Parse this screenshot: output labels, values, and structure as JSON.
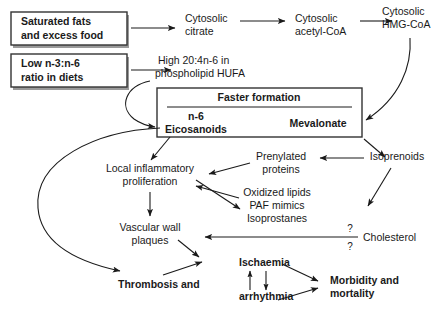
{
  "diagram": {
    "boxes": [
      {
        "id": "saturated-fats",
        "line1": "Saturated fats",
        "line2": "and excess food"
      },
      {
        "id": "low-ratio",
        "line1_pre": "Low ",
        "line1_n1": "n",
        "line1_mid": "-3:",
        "line1_n2": "n",
        "line1_post": "-6",
        "line2": "ratio in diets"
      }
    ],
    "central_box": {
      "header": "Faster formation",
      "left_line1_ital": "n",
      "left_line1_rest": "-6",
      "left_line2": "Eicosanoids",
      "right_label": "Mevalonate"
    },
    "nodes": [
      {
        "id": "cytosolic-citrate",
        "line1": "Cytosolic",
        "line2": "citrate"
      },
      {
        "id": "cytosolic-acetyl-coa",
        "line1": "Cytosolic",
        "line2": "acetyl-CoA"
      },
      {
        "id": "cytosolic-hmg-coa",
        "line1": "Cytosolic",
        "line2": "HMG-CoA"
      },
      {
        "id": "high-hufa",
        "line1_pre": "High 20:4",
        "line1_n": "n",
        "line1_post": "-6 in",
        "line2": "phospholipid HUFA"
      },
      {
        "id": "local-inflammatory",
        "line1": "Local inflammatory",
        "line2": "proliferation"
      },
      {
        "id": "prenylated-proteins",
        "line1": "Prenylated",
        "line2": "proteins"
      },
      {
        "id": "isoprenoids",
        "line1": "Isoprenoids"
      },
      {
        "id": "oxidized-lipids",
        "line1": "Oxidized lipids",
        "line2": "PAF mimics",
        "line3": "Isoprostanes"
      },
      {
        "id": "cholesterol",
        "line1": "Cholesterol"
      },
      {
        "id": "vascular-wall-plaques",
        "line1": "Vascular wall",
        "line2": "plaques"
      },
      {
        "id": "thrombosis",
        "line1": "Thrombosis and"
      },
      {
        "id": "ischaemia",
        "line1": "Ischaemia"
      },
      {
        "id": "arrhythmia",
        "line1": "arrhythmia"
      },
      {
        "id": "morbidity-mortality",
        "line1": "Morbidity and",
        "line2": "mortality"
      }
    ],
    "annotations": {
      "question_mark_top": "?",
      "question_mark_bottom": "?"
    },
    "colors": {
      "stroke": "#1a1a1a",
      "box_stroke": "#333333",
      "box_shadow": "#9a9a9a",
      "background": "#ffffff"
    }
  }
}
